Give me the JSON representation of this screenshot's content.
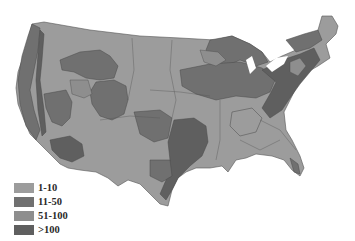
{
  "map": {
    "subject": "Contiguous United States choropleth (grayscale)",
    "colors": {
      "background": "#ffffff",
      "border": "#4a4a4a",
      "water_lakes": "#ffffff"
    }
  },
  "legend": {
    "items": [
      {
        "label": "1-10",
        "color": "#9c9c9c"
      },
      {
        "label": "11-50",
        "color": "#707070"
      },
      {
        "label": "51-100",
        "color": "#8e8e8e"
      },
      {
        "label": ">100",
        "color": "#5f5f5f"
      }
    ]
  }
}
